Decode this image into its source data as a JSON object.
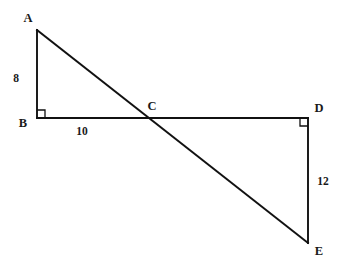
{
  "figure": {
    "kind": "geometry-diagram",
    "background_color": "#ffffff",
    "stroke_color": "#111111"
  },
  "points": {
    "A": {
      "label": "A",
      "x": 37,
      "y": 30,
      "label_x": 28,
      "label_y": 22
    },
    "B": {
      "label": "B",
      "x": 37,
      "y": 118,
      "label_x": 20,
      "label_y": 127
    },
    "C": {
      "label": "C",
      "x": 152,
      "y": 118,
      "label_x": 148,
      "label_y": 110
    },
    "D": {
      "label": "D",
      "x": 308,
      "y": 118,
      "label_x": 314,
      "label_y": 113
    },
    "E": {
      "label": "E",
      "x": 308,
      "y": 243,
      "label_x": 314,
      "label_y": 255
    }
  },
  "segments": [
    {
      "name": "segment-AB",
      "from": "A",
      "to": "B"
    },
    {
      "name": "segment-BD",
      "from": "B",
      "to": "D"
    },
    {
      "name": "segment-AE",
      "from": "A",
      "to": "E"
    },
    {
      "name": "segment-DE",
      "from": "D",
      "to": "E"
    }
  ],
  "measure_labels": [
    {
      "name": "length-AB",
      "text": "8",
      "x": 16,
      "y": 82,
      "side": "AB"
    },
    {
      "name": "length-BC",
      "text": "10",
      "x": 82,
      "y": 134,
      "side": "BC"
    },
    {
      "name": "length-DE",
      "text": "12",
      "x": 322,
      "y": 184,
      "side": "DE"
    }
  ],
  "right_angles": [
    {
      "name": "right-angle-B",
      "vertex": "B",
      "x": 37,
      "y": 110,
      "size": 8,
      "orientation": "up-right"
    },
    {
      "name": "right-angle-D",
      "vertex": "D",
      "x": 300,
      "y": 118,
      "size": 8,
      "orientation": "down-left"
    }
  ]
}
